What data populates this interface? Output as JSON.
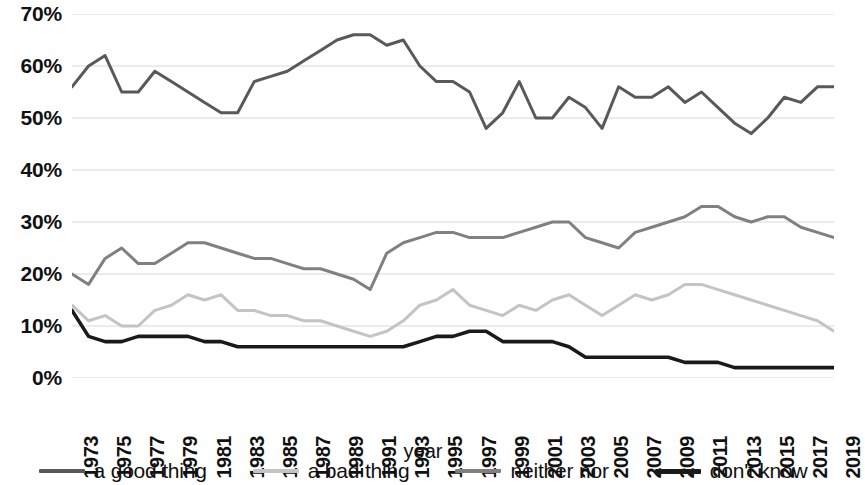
{
  "chart_data": {
    "type": "line",
    "title": "",
    "xlabel": "year",
    "ylabel": "",
    "ylim": [
      0,
      70
    ],
    "ytick_values": [
      70,
      60,
      50,
      40,
      30,
      20,
      10,
      0
    ],
    "ytick_labels": [
      "70%",
      "60%",
      "50%",
      "40%",
      "30%",
      "20%",
      "10%",
      "0%"
    ],
    "grid": true,
    "legend_position": "bottom",
    "x": [
      1973,
      1974,
      1975,
      1976,
      1977,
      1978,
      1979,
      1980,
      1981,
      1982,
      1983,
      1984,
      1985,
      1986,
      1987,
      1988,
      1989,
      1990,
      1991,
      1992,
      1993,
      1994,
      1995,
      1996,
      1997,
      1998,
      1999,
      2000,
      2001,
      2002,
      2003,
      2004,
      2005,
      2006,
      2007,
      2008,
      2009,
      2010,
      2011,
      2012,
      2013,
      2014,
      2015,
      2016,
      2017,
      2018,
      2019
    ],
    "xtick_labels": [
      "1973",
      "1975",
      "1977",
      "1979",
      "1981",
      "1983",
      "1985",
      "1987",
      "1989",
      "1991",
      "1993",
      "1995",
      "1997",
      "1999",
      "2001",
      "2003",
      "2005",
      "2007",
      "2009",
      "2011",
      "2013",
      "2015",
      "2017",
      "2019"
    ],
    "xtick_values": [
      1973,
      1975,
      1977,
      1979,
      1981,
      1983,
      1985,
      1987,
      1989,
      1991,
      1993,
      1995,
      1997,
      1999,
      2001,
      2003,
      2005,
      2007,
      2009,
      2011,
      2013,
      2015,
      2017,
      2019
    ],
    "series": [
      {
        "name": "a good thing",
        "color": "#595959",
        "width": 3.0,
        "values": [
          56,
          60,
          62,
          55,
          55,
          59,
          57,
          55,
          53,
          51,
          51,
          57,
          58,
          59,
          61,
          63,
          65,
          66,
          66,
          64,
          65,
          60,
          57,
          57,
          55,
          48,
          51,
          57,
          50,
          50,
          54,
          52,
          48,
          56,
          54,
          54,
          56,
          53,
          55,
          52,
          49,
          47,
          50,
          54,
          53,
          56,
          56
        ]
      },
      {
        "name": "a bad thing",
        "color": "#c4c4c4",
        "width": 3.0,
        "values": [
          14,
          11,
          12,
          10,
          10,
          13,
          14,
          16,
          15,
          16,
          13,
          13,
          12,
          12,
          11,
          11,
          10,
          9,
          8,
          9,
          11,
          14,
          15,
          17,
          14,
          13,
          12,
          14,
          13,
          15,
          16,
          14,
          12,
          14,
          16,
          15,
          16,
          18,
          18,
          17,
          16,
          15,
          14,
          13,
          12,
          11,
          9
        ]
      },
      {
        "name": "neither nor",
        "color": "#808080",
        "width": 3.0,
        "values": [
          20,
          18,
          23,
          25,
          22,
          22,
          24,
          26,
          26,
          25,
          24,
          23,
          23,
          22,
          21,
          21,
          20,
          19,
          17,
          24,
          26,
          27,
          28,
          28,
          27,
          27,
          27,
          28,
          29,
          30,
          30,
          27,
          26,
          25,
          28,
          29,
          30,
          31,
          33,
          33,
          31,
          30,
          31,
          31,
          29,
          28,
          27
        ]
      },
      {
        "name": "don't know",
        "color": "#1a1a1a",
        "width": 3.6,
        "values": [
          13,
          8,
          7,
          7,
          8,
          8,
          8,
          8,
          7,
          7,
          6,
          6,
          6,
          6,
          6,
          6,
          6,
          6,
          6,
          6,
          6,
          7,
          8,
          8,
          9,
          9,
          7,
          7,
          7,
          7,
          6,
          4,
          4,
          4,
          4,
          4,
          4,
          3,
          3,
          3,
          2,
          2,
          2,
          2,
          2,
          2,
          2
        ]
      }
    ]
  },
  "axis": {
    "x_title": "year"
  },
  "legend": {
    "items": [
      {
        "label": "a good thing",
        "color": "#595959"
      },
      {
        "label": "a bad thing",
        "color": "#c4c4c4"
      },
      {
        "label": "neither nor",
        "color": "#808080"
      },
      {
        "label": "don't know",
        "color": "#1a1a1a"
      }
    ]
  }
}
